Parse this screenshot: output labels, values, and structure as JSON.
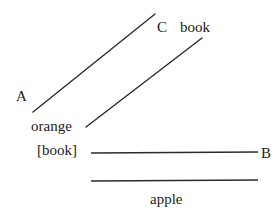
{
  "figure": {
    "background_color": "#ffffff",
    "stroke_color": "#2b2b2b",
    "text_color": "#1b1b1b"
  },
  "nodes": {
    "a": "A",
    "b": "B",
    "c": "C"
  },
  "words": {
    "book_top": "book",
    "orange": "orange",
    "book_bracket": "[book]",
    "apple": "apple"
  },
  "edges": [
    {
      "name": "edge-a-to-c",
      "from_label": "A",
      "to_label": "C",
      "x1": 33,
      "y1": 112,
      "x2": 155,
      "y2": 14,
      "orientation": "diagonal-up-right"
    },
    {
      "name": "edge-orange-to-book",
      "from_label": "orange",
      "to_label": "book",
      "x1": 86,
      "y1": 127,
      "x2": 202,
      "y2": 38,
      "orientation": "diagonal-up-right"
    },
    {
      "name": "edge-bookbracket-to-b",
      "from_label": "[book]",
      "to_label": "B",
      "x1": 91,
      "y1": 153,
      "x2": 258,
      "y2": 152,
      "orientation": "horizontal"
    },
    {
      "name": "edge-apple",
      "from_label": "",
      "to_label": "apple",
      "x1": 91,
      "y1": 181,
      "x2": 258,
      "y2": 180,
      "orientation": "horizontal"
    }
  ]
}
